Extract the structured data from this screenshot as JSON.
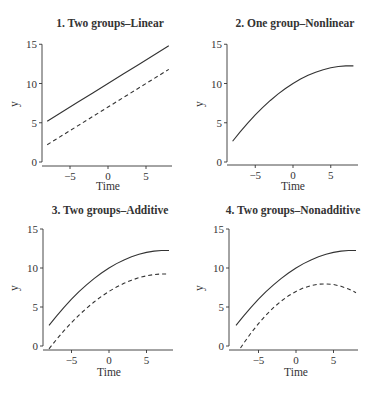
{
  "figure": {
    "background": "#ffffff",
    "line_color": "#333333"
  },
  "chart_data": [
    {
      "id": "p1",
      "type": "line",
      "title": "1.  Two groups–Linear",
      "xlabel": "Time",
      "ylabel": "y",
      "xlim": [
        -8,
        8
      ],
      "ylim": [
        0,
        15
      ],
      "xticks": [
        -5,
        0,
        5
      ],
      "yticks": [
        0,
        5,
        10,
        15
      ],
      "grid": false,
      "legend": null,
      "series": [
        {
          "name": "group 1",
          "style": "solid",
          "x": [
            -8,
            -6,
            -4,
            -2,
            0,
            2,
            4,
            6,
            8
          ],
          "y": [
            5.2,
            6.4,
            7.6,
            8.8,
            10.0,
            11.2,
            12.4,
            13.6,
            14.8
          ]
        },
        {
          "name": "group 2",
          "style": "dashed",
          "x": [
            -8,
            -6,
            -4,
            -2,
            0,
            2,
            4,
            6,
            8
          ],
          "y": [
            2.2,
            3.4,
            4.6,
            5.8,
            7.0,
            8.2,
            9.4,
            10.6,
            11.8
          ]
        }
      ]
    },
    {
      "id": "p2",
      "type": "line",
      "title": "2.  One group–Nonlinear",
      "xlabel": "Time",
      "ylabel": "y",
      "xlim": [
        -8,
        8
      ],
      "ylim": [
        0,
        15
      ],
      "xticks": [
        -5,
        0,
        5
      ],
      "yticks": [
        0,
        5,
        10,
        15
      ],
      "grid": false,
      "legend": null,
      "series": [
        {
          "name": "group 1",
          "style": "solid",
          "x": [
            -8,
            -7,
            -6,
            -5,
            -4,
            -3,
            -2,
            -1,
            0,
            1,
            2,
            3,
            4,
            5,
            6,
            7,
            8
          ],
          "y": [
            2.64,
            3.84,
            4.96,
            6.0,
            6.96,
            7.84,
            8.64,
            9.36,
            10.0,
            10.56,
            11.04,
            11.44,
            11.76,
            12.0,
            12.16,
            12.24,
            12.24
          ]
        }
      ]
    },
    {
      "id": "p3",
      "type": "line",
      "title": "3.  Two groups–Additive",
      "xlabel": "Time",
      "ylabel": "y",
      "xlim": [
        -8,
        8
      ],
      "ylim": [
        0,
        15
      ],
      "xticks": [
        -5,
        0,
        5
      ],
      "yticks": [
        0,
        5,
        10,
        15
      ],
      "grid": false,
      "legend": null,
      "series": [
        {
          "name": "group 1",
          "style": "solid",
          "x": [
            -8,
            -7,
            -6,
            -5,
            -4,
            -3,
            -2,
            -1,
            0,
            1,
            2,
            3,
            4,
            5,
            6,
            7,
            8
          ],
          "y": [
            2.64,
            3.84,
            4.96,
            6.0,
            6.96,
            7.84,
            8.64,
            9.36,
            10.0,
            10.56,
            11.04,
            11.44,
            11.76,
            12.0,
            12.16,
            12.24,
            12.24
          ]
        },
        {
          "name": "group 2",
          "style": "dashed",
          "x": [
            -8,
            -7,
            -6,
            -5,
            -4,
            -3,
            -2,
            -1,
            0,
            1,
            2,
            3,
            4,
            5,
            6,
            7,
            8
          ],
          "y": [
            -0.36,
            0.84,
            1.96,
            3.0,
            3.96,
            4.84,
            5.64,
            6.36,
            7.0,
            7.56,
            8.04,
            8.44,
            8.76,
            9.0,
            9.16,
            9.24,
            9.24
          ]
        }
      ]
    },
    {
      "id": "p4",
      "type": "line",
      "title": "4. Two groups–Nonadditive",
      "xlabel": "Time",
      "ylabel": "y",
      "xlim": [
        -8,
        8
      ],
      "ylim": [
        0,
        15
      ],
      "xticks": [
        -5,
        0,
        5
      ],
      "yticks": [
        0,
        5,
        10,
        15
      ],
      "grid": false,
      "legend": null,
      "series": [
        {
          "name": "group 1",
          "style": "solid",
          "x": [
            -8,
            -7,
            -6,
            -5,
            -4,
            -3,
            -2,
            -1,
            0,
            1,
            2,
            3,
            4,
            5,
            6,
            7,
            8
          ],
          "y": [
            2.64,
            3.84,
            4.96,
            6.0,
            6.96,
            7.84,
            8.64,
            9.36,
            10.0,
            10.56,
            11.04,
            11.44,
            11.76,
            12.0,
            12.16,
            12.24,
            12.24
          ]
        },
        {
          "name": "group 2",
          "style": "dashed",
          "x": [
            -7.4,
            -7,
            -6,
            -5,
            -4,
            -3,
            -2,
            -1,
            0,
            1,
            2,
            3,
            4,
            5,
            6,
            7,
            8
          ],
          "y": [
            -0.26,
            0.32,
            1.66,
            2.88,
            3.96,
            4.92,
            5.74,
            6.44,
            7.0,
            7.44,
            7.74,
            7.92,
            7.96,
            7.88,
            7.66,
            7.32,
            6.84
          ]
        }
      ]
    }
  ]
}
